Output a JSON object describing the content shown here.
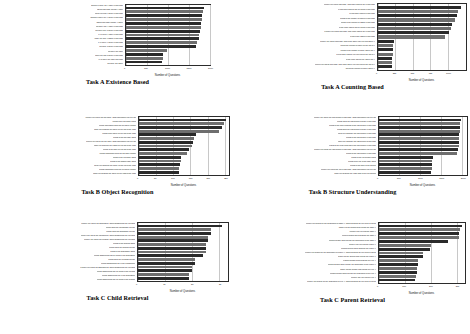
{
  "figure": {
    "xlabel": "Number of Questions",
    "bar_color": "#2a2a2a",
    "bar_color_alt": "#6e6e6e",
    "background": "#ffffff"
  },
  "chart_data": [
    {
      "type": "bar",
      "orientation": "horizontal",
      "title": "Task A Existence Based",
      "xlabel": "Number of Questions",
      "ylabel": "",
      "xlim": [
        0,
        2000
      ],
      "xticks": [
        0,
        500,
        1000,
        1500,
        2000
      ],
      "grid": true,
      "categories": [
        "Confirm if there are X table in this page.",
        "Does this page include X table?",
        "Can you find X figure in this page?",
        "Confirm if there are X figure in this page.",
        "Does this page include X figure?",
        "Is there only X table in this page?",
        "Is there only a figure in this page?",
        "Are there X table in this page?",
        "Can you find X tables in this page?",
        "Are there X figure in this page?",
        "Is there a figure in this page?",
        "Is there any table?",
        "Can you find a figure in this page?",
        "Are there any table this page?",
        "Is there any figure?"
      ],
      "values": [
        1860,
        1840,
        1830,
        1820,
        1800,
        1790,
        1770,
        1760,
        1750,
        1700,
        1680,
        980,
        900,
        890,
        880
      ]
    },
    {
      "type": "bar",
      "orientation": "horizontal",
      "title": "Task A Counting Based",
      "xlabel": "Number of Questions",
      "ylabel": "",
      "xlim": [
        0,
        1250
      ],
      "xticks": [
        0,
        250,
        500,
        750,
        1000
      ],
      "grid": true,
      "categories": [
        "When you check this page, how many figures are in this page?",
        "How many figures can be found in this page?",
        "How many figures in this page?",
        "What is the number of figures in this page?",
        "What is the number of tables in this page?",
        "How many tables can be found in this page?",
        "When you check this page, how many tables are in this page?",
        "How many tables in this page?",
        "When you check this page, how many figure can you find above X?",
        "Count the number of figure on the top of X.",
        "What is the number of figure above the X?",
        "How many figures you can find on the top of X?",
        "How many figures are above the X?",
        "When you check this page, how many figure you can find on the top of X?",
        "Count the number of figure above X."
      ],
      "values": [
        1180,
        1140,
        1130,
        1100,
        1060,
        1040,
        1010,
        960,
        230,
        225,
        220,
        215,
        210,
        205,
        200
      ]
    },
    {
      "type": "bar",
      "orientation": "horizontal",
      "title": "Task B Object Recognition",
      "xlabel": "Number of Questions",
      "ylabel": "",
      "xlim": [
        0,
        260
      ],
      "xticks": [
        0,
        50,
        100,
        150,
        200,
        250
      ],
      "grid": true,
      "categories": [
        "When you check the top figure, what information can you get?",
        "What is the top figure about?",
        "What information does the top figure contain?",
        "Can you describe the figure on the top of the page?",
        "What is the figure on the top of the page?",
        "What is the top table about?",
        "When you check the top table, what information can you get?",
        "Can you describe the tables on the top of the page?",
        "What is the table on the top of the page?",
        "What information does the top table contain?",
        "What is the left figure about?",
        "What is the bottom table about?",
        "Can you describe the figure on the left of the page?",
        "What information does the left figure contain?",
        "Can you describe the figure on the right of the page?"
      ],
      "values": [
        252,
        248,
        240,
        232,
        166,
        160,
        158,
        154,
        146,
        140,
        124,
        122,
        120,
        118,
        116
      ]
    },
    {
      "type": "bar",
      "orientation": "horizontal",
      "title": "Task B Structure Understanding",
      "xlabel": "Number of Questions",
      "ylabel": "",
      "xlim": [
        0,
        2100
      ],
      "xticks": [
        0,
        500,
        1000,
        1500,
        2000
      ],
      "grid": true,
      "categories": [
        "When you check the first section of this page, what information can you get?",
        "What does the last section include in this page?",
        "What is the main contents of the last section in this page?",
        "What does the first section include in this page?",
        "Can you describe the first section in this page?",
        "What is the first section in this page?",
        "Can you describe the last section of this page?",
        "What is the main contents of the first section in this page?",
        "When you check the last section of this page, what information can you get?",
        "What is the last section in this page?",
        "What is the left section about?",
        "What is the left of the page about?",
        "What is the topic of left section?",
        "When you check the left of this page, what information can you get?",
        "Can you describe the main topic of the left section?"
      ],
      "values": [
        1960,
        1950,
        1940,
        1935,
        1930,
        1925,
        1920,
        1915,
        1905,
        1880,
        1290,
        1285,
        1275,
        1270,
        1260
      ]
    },
    {
      "type": "bar",
      "orientation": "horizontal",
      "title": "Task C Child Retrieval",
      "xlabel": "Number of Questions",
      "ylabel": "",
      "xlim": [
        0,
        33
      ],
      "xticks": [
        0,
        10,
        20,
        30
      ],
      "grid": true,
      "categories": [
        "When you check the Discussion, which subsections are included?",
        "What does the Introduction include?",
        "What does the Discussion include?",
        "When you check the Introduction, which subsections are included?",
        "When you check the Results, which subsections are included?",
        "What is the Results about?",
        "What does the Results include?",
        "What is the Discussion about?",
        "What subsections can be found in the Discussion?",
        "What does the Methods include?",
        "What subsections are in the Introduction?",
        "When you check the Background, which subsections are included?",
        "What subsections can be found in the Method?",
        "What subsections are in the Discussion?",
        "What subsections can be found in the Results?"
      ],
      "values": [
        31,
        27,
        27,
        26,
        26,
        25,
        25,
        25,
        24,
        21,
        21,
        20,
        20,
        19,
        19
      ]
    },
    {
      "type": "bar",
      "orientation": "horizontal",
      "title": "Task C Parent Retrieval",
      "xlabel": "Number of Questions",
      "ylabel": "",
      "xlim": [
        0,
        330
      ],
      "xticks": [
        0,
        100,
        200,
        300
      ],
      "grid": true,
      "categories": [
        "When you search for the description of Table X, which sections do you need to check?",
        "Name out the section that include the Table X.",
        "Where can you find the Table X?",
        "Which section does describe the Table X?",
        "Which person does include the description of the Table X?",
        "Where can you find the Figure X?",
        "Which section does describe the Figure X?",
        "When you search for the description of Figure X, which sections do you need to check?",
        "Name out the section that include the Figure X.",
        "Which section does describe the Fig. X?",
        "Which section does include the description of the Figure X?",
        "Name out the section that include the Fig. X.",
        "Which section does include the description of the Fig. X?",
        "Where can you find the Fig. X?",
        "When you search for the description of Fig. X, which sections do you need to check?"
      ],
      "values": [
        320,
        314,
        310,
        308,
        268,
        200,
        196,
        172,
        170,
        152,
        150,
        148,
        146,
        142,
        140
      ]
    }
  ]
}
